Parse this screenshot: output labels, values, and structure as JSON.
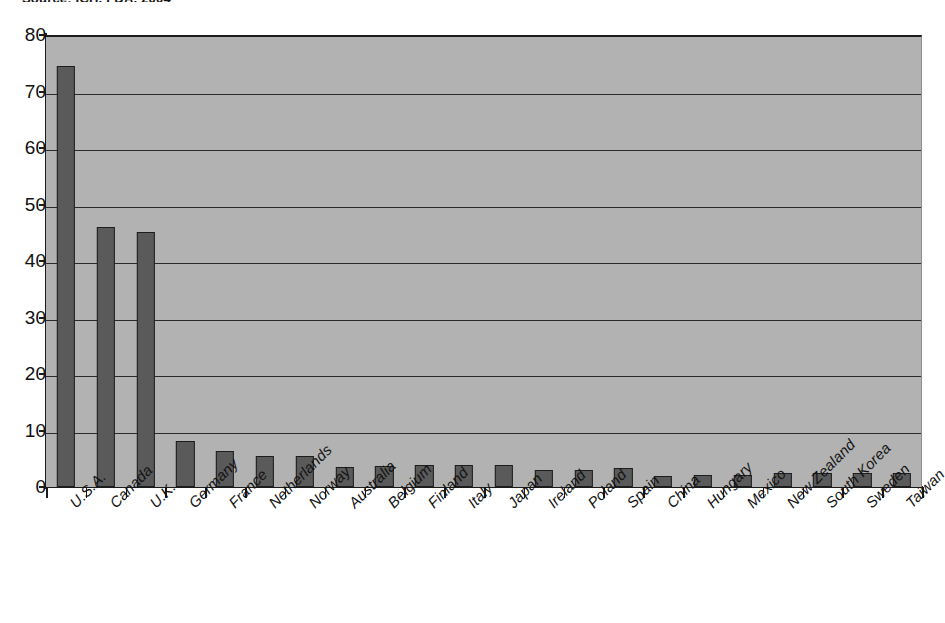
{
  "source_note": "Source: ICH, FDA, 2004",
  "chart_data": {
    "type": "bar",
    "title": "",
    "subtitle": "",
    "xlabel": "",
    "ylabel": "",
    "ylim": [
      0,
      80
    ],
    "ytick_step": 10,
    "yticks": [
      "0",
      "10",
      "20",
      "30",
      "40",
      "50",
      "60",
      "70",
      "80"
    ],
    "grid": true,
    "grid_axis": "y",
    "legend": false,
    "legend_position": "none",
    "bar_color": "#5a5a5a",
    "bar_edge_color": "#1d1d1d",
    "plot_background": "#b2b2b2",
    "axis_color": "#1b1b1b",
    "categories": [
      "U.S.A.",
      "Canada",
      "U.K.",
      "Germany",
      "France",
      "Netherlands",
      "Norway",
      "Australia",
      "Belgium",
      "Finland",
      "Italy",
      "Japan",
      "Ireland",
      "Poland",
      "Spain",
      "China",
      "Hungary",
      "Mexico",
      "New Zealand",
      "South Korea",
      "Sweden",
      "Taiwan"
    ],
    "values": [
      74.5,
      46.0,
      45.2,
      8.2,
      6.3,
      5.5,
      5.5,
      3.6,
      3.7,
      3.9,
      3.9,
      3.9,
      3.1,
      3.1,
      3.4,
      2.0,
      2.1,
      2.1,
      2.4,
      2.4,
      2.4,
      2.5
    ]
  }
}
